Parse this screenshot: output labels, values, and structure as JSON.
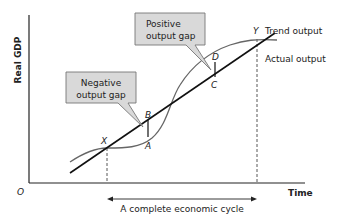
{
  "diagram": {
    "y_axis_label": "Real GDP",
    "x_axis_label": "Time",
    "origin_label": "O",
    "lines": {
      "trend": "Trend output",
      "actual": "Actual output"
    },
    "points": {
      "X": "X",
      "Y": "Y",
      "A": "A",
      "B": "B",
      "C": "C",
      "D": "D"
    },
    "callouts": {
      "negative": [
        "Negative",
        "output gap"
      ],
      "positive": [
        "Positive",
        "output gap"
      ]
    },
    "cycle_label": "A complete economic cycle",
    "colors": {
      "trend_line": "#111111",
      "actual_line": "#555555",
      "callout_fill": "#d9d9d9",
      "callout_border": "#777777",
      "axis": "#222222"
    }
  }
}
